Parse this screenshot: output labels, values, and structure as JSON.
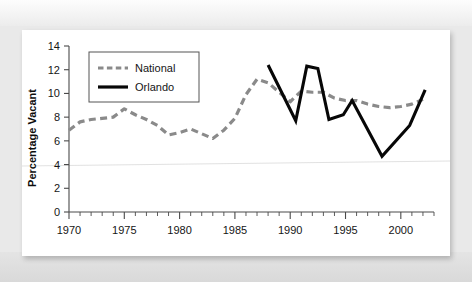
{
  "figure": {
    "background_color": "#e9e9e9",
    "plate_color": "#ffffff"
  },
  "chart_data": {
    "type": "line",
    "title": "",
    "xlabel": "",
    "ylabel": "Percentage Vacant",
    "xlim": [
      1970,
      2003
    ],
    "ylim": [
      0,
      14
    ],
    "ytick_values": [
      0,
      2,
      4,
      6,
      8,
      10,
      12,
      14
    ],
    "ytick_labels": [
      "0",
      "2",
      "4",
      "6",
      "8",
      "10",
      "12",
      "14"
    ],
    "xtick_values": [
      1970,
      1975,
      1980,
      1985,
      1990,
      1995,
      2000
    ],
    "xtick_labels": [
      "1970",
      "1975",
      "1980",
      "1985",
      "1990",
      "1995",
      "2000"
    ],
    "x_minor_step": 1,
    "grid": false,
    "legend_position": "upper left",
    "series": [
      {
        "name": "National",
        "style": "dashed",
        "color": "#8a8a8a",
        "x": [
          1970,
          1971,
          1972,
          1973,
          1974,
          1975,
          1976,
          1977,
          1978,
          1979,
          1980,
          1981,
          1982,
          1983,
          1984,
          1985,
          1986,
          1987,
          1988,
          1989,
          1990,
          1991,
          1992,
          1993,
          1994,
          1995,
          1996,
          1997,
          1998,
          1999,
          2000,
          2001,
          2002
        ],
        "values": [
          6.9,
          7.6,
          7.8,
          7.9,
          8.0,
          8.7,
          8.2,
          7.8,
          7.3,
          6.5,
          6.7,
          7.0,
          6.6,
          6.2,
          6.9,
          7.9,
          9.9,
          11.2,
          10.9,
          10.1,
          9.3,
          10.2,
          10.1,
          10.1,
          9.6,
          9.4,
          9.4,
          9.1,
          8.9,
          8.8,
          8.9,
          9.1,
          9.5
        ]
      },
      {
        "name": "Orlando",
        "style": "solid",
        "color": "#070707",
        "x": [
          1988,
          1990.5,
          1991.5,
          1992.5,
          1993.5,
          1994.8,
          1995.6,
          1998.3,
          2000.8,
          2002.2
        ],
        "values": [
          12.4,
          7.7,
          12.3,
          12.1,
          7.8,
          8.2,
          9.4,
          4.7,
          7.3,
          10.3
        ]
      }
    ]
  },
  "legend": {
    "entries": [
      {
        "label": "National"
      },
      {
        "label": "Orlando"
      }
    ]
  },
  "axis": {
    "y_title": "Percentage Vacant"
  }
}
